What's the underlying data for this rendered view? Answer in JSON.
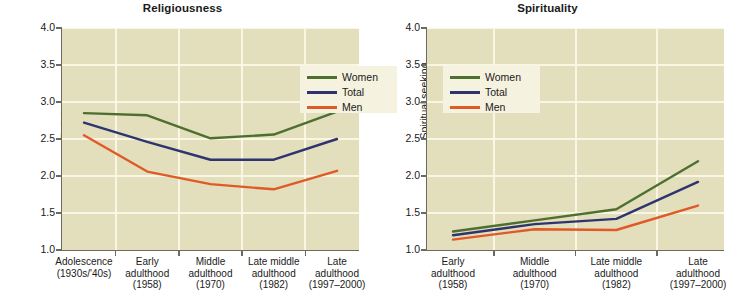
{
  "figure": {
    "background_color": "#ffffff",
    "plot_background_color": "#e3debb",
    "gridline_color": "#fbf8e6",
    "axis_color": "#6a6a62"
  },
  "series_colors": {
    "women": "#4d7031",
    "total": "#2e3470",
    "men": "#e05a28"
  },
  "legend": {
    "entries": [
      {
        "label": "Women",
        "color": "#4d7031"
      },
      {
        "label": "Total",
        "color": "#2e3470"
      },
      {
        "label": "Men",
        "color": "#e05a28"
      }
    ]
  },
  "chart_data": [
    {
      "type": "line",
      "title": "Religiousness",
      "xlabel": "",
      "ylabel": "Religiousness",
      "ylim": [
        1.0,
        4.0
      ],
      "yticks": [
        "1.0",
        "1.5",
        "2.0",
        "2.5",
        "3.0",
        "3.5",
        "4.0"
      ],
      "ytick_values": [
        1.0,
        1.5,
        2.0,
        2.5,
        3.0,
        3.5,
        4.0
      ],
      "grid": true,
      "legend_position": "upper right",
      "categories": [
        "Adolescence\n(1930s/'40s)",
        "Early\nadulthood\n(1958)",
        "Middle\nadulthood\n(1970)",
        "Late middle\nadulthood\n(1982)",
        "Late\nadulthood\n(1997–2000)"
      ],
      "category_lines": [
        [
          "Adolescence",
          "(1930s/'40s)"
        ],
        [
          "Early",
          "adulthood",
          "(1958)"
        ],
        [
          "Middle",
          "adulthood",
          "(1970)"
        ],
        [
          "Late middle",
          "adulthood",
          "(1982)"
        ],
        [
          "Late",
          "adulthood",
          "(1997–2000)"
        ]
      ],
      "series": [
        {
          "name": "Women",
          "color": "#4d7031",
          "values": [
            2.85,
            2.82,
            2.51,
            2.56,
            2.87
          ]
        },
        {
          "name": "Total",
          "color": "#2e3470",
          "values": [
            2.72,
            2.46,
            2.22,
            2.22,
            2.5
          ]
        },
        {
          "name": "Men",
          "color": "#e05a28",
          "values": [
            2.55,
            2.06,
            1.89,
            1.82,
            2.07
          ]
        }
      ]
    },
    {
      "type": "line",
      "title": "Spirituality",
      "xlabel": "",
      "ylabel": "Spiritual seeking",
      "ylim": [
        1.0,
        4.0
      ],
      "yticks": [
        "1.0",
        "1.5",
        "2.0",
        "2.5",
        "3.0",
        "3.5",
        "4.0"
      ],
      "ytick_values": [
        1.0,
        1.5,
        2.0,
        2.5,
        3.0,
        3.5,
        4.0
      ],
      "grid": true,
      "legend_position": "upper left",
      "categories": [
        "Early\nadulthood\n(1958)",
        "Middle\nadulthood\n(1970)",
        "Late middle\nadulthood\n(1982)",
        "Late\nadulthood\n(1997–2000)"
      ],
      "category_lines": [
        [
          "Early",
          "adulthood",
          "(1958)"
        ],
        [
          "Middle",
          "adulthood",
          "(1970)"
        ],
        [
          "Late middle",
          "adulthood",
          "(1982)"
        ],
        [
          "Late",
          "adulthood",
          "(1997–2000)"
        ]
      ],
      "series": [
        {
          "name": "Women",
          "color": "#4d7031",
          "values": [
            1.25,
            1.4,
            1.55,
            2.2
          ]
        },
        {
          "name": "Total",
          "color": "#2e3470",
          "values": [
            1.2,
            1.35,
            1.42,
            1.92
          ]
        },
        {
          "name": "Men",
          "color": "#e05a28",
          "values": [
            1.14,
            1.28,
            1.27,
            1.6
          ]
        }
      ]
    }
  ]
}
